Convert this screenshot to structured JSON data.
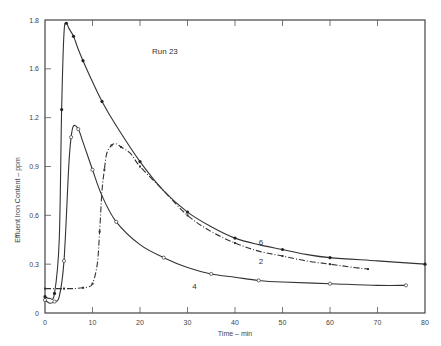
{
  "chart_data": {
    "type": "line",
    "title": "",
    "annotation": "Run 23",
    "xlabel": "Time – min",
    "ylabel": "Effluent Iron Content – ppm",
    "xlim": [
      0,
      80
    ],
    "ylim": [
      0,
      1.8
    ],
    "x_ticks": [
      0,
      10,
      20,
      30,
      40,
      50,
      60,
      70,
      80
    ],
    "y_ticks": [
      0,
      0.3,
      0.6,
      0.9,
      1.2,
      1.5,
      1.8
    ],
    "y_tick_labels": [
      "0",
      "0.3",
      "0.6",
      "0.9",
      "1.2",
      "1.6",
      "1.8"
    ],
    "grid": false,
    "legend": "inline curve labels",
    "series": [
      {
        "name": "6",
        "marker": "filled-circle",
        "x": [
          0,
          1,
          2,
          3,
          3.5,
          4,
          4.5,
          5,
          6,
          7,
          8,
          10,
          12,
          15,
          20,
          25,
          30,
          35,
          40,
          45,
          50,
          55,
          60,
          70,
          80
        ],
        "y": [
          0.1,
          0.09,
          0.12,
          0.45,
          1.25,
          1.72,
          1.78,
          1.75,
          1.7,
          1.62,
          1.55,
          1.42,
          1.3,
          1.15,
          0.93,
          0.75,
          0.62,
          0.53,
          0.46,
          0.42,
          0.39,
          0.36,
          0.34,
          0.32,
          0.3
        ]
      },
      {
        "name": "2",
        "marker": "small-square",
        "x": [
          0,
          2,
          4,
          6,
          8,
          9,
          10,
          11,
          11.5,
          12,
          12.5,
          13,
          14,
          15,
          16,
          18,
          20,
          25,
          30,
          35,
          40,
          45,
          50,
          55,
          60,
          65,
          68
        ],
        "y": [
          0.15,
          0.15,
          0.15,
          0.15,
          0.155,
          0.16,
          0.18,
          0.3,
          0.5,
          0.75,
          0.88,
          0.98,
          1.03,
          1.04,
          1.02,
          0.98,
          0.9,
          0.75,
          0.6,
          0.5,
          0.43,
          0.38,
          0.35,
          0.32,
          0.3,
          0.28,
          0.27
        ]
      },
      {
        "name": "4",
        "marker": "open-circle",
        "x": [
          0,
          1,
          2,
          3,
          4,
          5,
          5.5,
          6,
          7,
          8,
          10,
          12,
          15,
          20,
          25,
          30,
          35,
          40,
          45,
          50,
          60,
          70,
          76
        ],
        "y": [
          0.08,
          0.06,
          0.07,
          0.1,
          0.32,
          0.9,
          1.08,
          1.15,
          1.13,
          1.05,
          0.88,
          0.72,
          0.56,
          0.42,
          0.34,
          0.28,
          0.24,
          0.22,
          0.2,
          0.19,
          0.18,
          0.17,
          0.17
        ]
      }
    ],
    "curve_labels": [
      {
        "text": "6",
        "x": 45,
        "y": 0.42
      },
      {
        "text": "2",
        "x": 45,
        "y": 0.3
      },
      {
        "text": "4",
        "x": 31,
        "y": 0.15
      }
    ]
  }
}
